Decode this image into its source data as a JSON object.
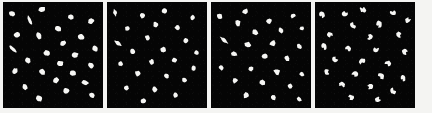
{
  "figure": {
    "panel_count": 4,
    "background_color": "#050505",
    "particle_color": "#f6f6f4",
    "page_background": "#f4f4f2",
    "width_px": 432,
    "height_px": 113
  },
  "layout": {
    "margin_left_px": 3,
    "margin_right_px": 4,
    "margin_top_px": 2,
    "margin_bottom_px": 5,
    "gap_px": 4,
    "panel_width_px": 100,
    "panel_height_px": 106
  },
  "chart_data": {
    "type": "scatter",
    "xlabel": "",
    "ylabel": "",
    "xlim": [
      0,
      100
    ],
    "ylim": [
      0,
      100
    ],
    "grid": false,
    "legend_position": "none",
    "panels": [
      {
        "index": 1,
        "label": "panel-1",
        "shape_style": "rounded-ellipse",
        "particle_count": 26,
        "particles": [
          {
            "x": 9,
            "y": 11,
            "rx": 3.0,
            "ry": 2.3,
            "rot": 20,
            "style": "ellipse"
          },
          {
            "x": 39,
            "y": 7,
            "rx": 3.4,
            "ry": 2.5,
            "rot": -15,
            "style": "ellipse"
          },
          {
            "x": 27,
            "y": 17,
            "rx": 4.6,
            "ry": 2.4,
            "rot": 62,
            "style": "comma"
          },
          {
            "x": 68,
            "y": 14,
            "rx": 2.9,
            "ry": 2.4,
            "rot": 5,
            "style": "ellipse"
          },
          {
            "x": 88,
            "y": 18,
            "rx": 3.1,
            "ry": 2.5,
            "rot": -28,
            "style": "ellipse"
          },
          {
            "x": 55,
            "y": 25,
            "rx": 3.2,
            "ry": 2.5,
            "rot": 40,
            "style": "ellipse"
          },
          {
            "x": 14,
            "y": 31,
            "rx": 3.0,
            "ry": 2.4,
            "rot": -10,
            "style": "ellipse"
          },
          {
            "x": 36,
            "y": 32,
            "rx": 3.3,
            "ry": 2.4,
            "rot": 70,
            "style": "ellipse"
          },
          {
            "x": 78,
            "y": 33,
            "rx": 3.4,
            "ry": 2.6,
            "rot": 15,
            "style": "ellipse"
          },
          {
            "x": 60,
            "y": 39,
            "rx": 3.0,
            "ry": 2.3,
            "rot": -35,
            "style": "ellipse"
          },
          {
            "x": 10,
            "y": 44,
            "rx": 5.0,
            "ry": 2.4,
            "rot": 40,
            "style": "comma"
          },
          {
            "x": 92,
            "y": 44,
            "rx": 3.0,
            "ry": 2.4,
            "rot": 25,
            "style": "ellipse"
          },
          {
            "x": 44,
            "y": 48,
            "rx": 3.2,
            "ry": 2.6,
            "rot": 10,
            "style": "ellipse"
          },
          {
            "x": 72,
            "y": 50,
            "rx": 3.3,
            "ry": 2.5,
            "rot": -20,
            "style": "ellipse"
          },
          {
            "x": 25,
            "y": 55,
            "rx": 3.1,
            "ry": 2.4,
            "rot": 55,
            "style": "ellipse"
          },
          {
            "x": 57,
            "y": 58,
            "rx": 3.4,
            "ry": 2.7,
            "rot": 0,
            "style": "ellipse"
          },
          {
            "x": 88,
            "y": 60,
            "rx": 3.0,
            "ry": 2.4,
            "rot": 30,
            "style": "ellipse"
          },
          {
            "x": 12,
            "y": 65,
            "rx": 3.0,
            "ry": 2.4,
            "rot": -25,
            "style": "ellipse"
          },
          {
            "x": 39,
            "y": 66,
            "rx": 3.3,
            "ry": 2.5,
            "rot": 45,
            "style": "ellipse"
          },
          {
            "x": 70,
            "y": 67,
            "rx": 3.2,
            "ry": 2.4,
            "rot": 12,
            "style": "ellipse"
          },
          {
            "x": 53,
            "y": 74,
            "rx": 3.1,
            "ry": 2.4,
            "rot": -40,
            "style": "ellipse"
          },
          {
            "x": 82,
            "y": 76,
            "rx": 3.6,
            "ry": 2.0,
            "rot": 18,
            "style": "ellipse"
          },
          {
            "x": 22,
            "y": 80,
            "rx": 3.0,
            "ry": 2.3,
            "rot": 60,
            "style": "ellipse"
          },
          {
            "x": 63,
            "y": 84,
            "rx": 3.1,
            "ry": 2.5,
            "rot": -8,
            "style": "ellipse"
          },
          {
            "x": 36,
            "y": 91,
            "rx": 3.2,
            "ry": 2.6,
            "rot": 28,
            "style": "ellipse"
          },
          {
            "x": 89,
            "y": 88,
            "rx": 2.8,
            "ry": 2.3,
            "rot": 35,
            "style": "ellipse"
          }
        ]
      },
      {
        "index": 2,
        "label": "panel-2",
        "shape_style": "angular-teardrop",
        "particle_count": 24,
        "particles": [
          {
            "x": 8,
            "y": 10,
            "rx": 3.6,
            "ry": 2.6,
            "rot": 75,
            "style": "bone"
          },
          {
            "x": 36,
            "y": 13,
            "rx": 3.3,
            "ry": 2.6,
            "rot": 20,
            "style": "teardrop"
          },
          {
            "x": 58,
            "y": 8,
            "rx": 3.2,
            "ry": 2.5,
            "rot": -30,
            "style": "teardrop"
          },
          {
            "x": 86,
            "y": 15,
            "rx": 3.1,
            "ry": 2.5,
            "rot": 45,
            "style": "teardrop"
          },
          {
            "x": 21,
            "y": 25,
            "rx": 3.0,
            "ry": 2.4,
            "rot": 10,
            "style": "teardrop"
          },
          {
            "x": 49,
            "y": 22,
            "rx": 3.4,
            "ry": 2.6,
            "rot": 60,
            "style": "teardrop"
          },
          {
            "x": 71,
            "y": 24,
            "rx": 3.2,
            "ry": 2.5,
            "rot": -15,
            "style": "teardrop"
          },
          {
            "x": 11,
            "y": 39,
            "rx": 5.0,
            "ry": 2.5,
            "rot": 35,
            "style": "bone"
          },
          {
            "x": 41,
            "y": 34,
            "rx": 3.1,
            "ry": 2.4,
            "rot": 25,
            "style": "teardrop"
          },
          {
            "x": 79,
            "y": 36,
            "rx": 3.3,
            "ry": 2.6,
            "rot": -40,
            "style": "teardrop"
          },
          {
            "x": 26,
            "y": 47,
            "rx": 3.2,
            "ry": 2.5,
            "rot": 50,
            "style": "teardrop"
          },
          {
            "x": 57,
            "y": 45,
            "rx": 3.4,
            "ry": 2.7,
            "rot": 5,
            "style": "teardrop"
          },
          {
            "x": 90,
            "y": 48,
            "rx": 3.0,
            "ry": 2.4,
            "rot": 30,
            "style": "teardrop"
          },
          {
            "x": 14,
            "y": 58,
            "rx": 3.1,
            "ry": 2.5,
            "rot": -20,
            "style": "teardrop"
          },
          {
            "x": 45,
            "y": 57,
            "rx": 3.3,
            "ry": 2.6,
            "rot": 40,
            "style": "teardrop"
          },
          {
            "x": 68,
            "y": 55,
            "rx": 3.2,
            "ry": 2.5,
            "rot": 15,
            "style": "teardrop"
          },
          {
            "x": 87,
            "y": 62,
            "rx": 3.0,
            "ry": 2.4,
            "rot": -35,
            "style": "teardrop"
          },
          {
            "x": 31,
            "y": 68,
            "rx": 3.4,
            "ry": 2.7,
            "rot": 55,
            "style": "teardrop"
          },
          {
            "x": 60,
            "y": 70,
            "rx": 3.1,
            "ry": 2.5,
            "rot": 0,
            "style": "teardrop"
          },
          {
            "x": 78,
            "y": 74,
            "rx": 3.2,
            "ry": 2.5,
            "rot": 25,
            "style": "teardrop"
          },
          {
            "x": 20,
            "y": 81,
            "rx": 3.0,
            "ry": 2.4,
            "rot": -10,
            "style": "teardrop"
          },
          {
            "x": 48,
            "y": 83,
            "rx": 3.3,
            "ry": 2.6,
            "rot": 48,
            "style": "teardrop"
          },
          {
            "x": 69,
            "y": 88,
            "rx": 3.1,
            "ry": 2.5,
            "rot": 18,
            "style": "teardrop"
          },
          {
            "x": 37,
            "y": 93,
            "rx": 3.2,
            "ry": 2.5,
            "rot": -28,
            "style": "teardrop"
          }
        ]
      },
      {
        "index": 3,
        "label": "panel-3",
        "shape_style": "irregular-polygon",
        "particle_count": 25,
        "particles": [
          {
            "x": 9,
            "y": 14,
            "rx": 3.2,
            "ry": 2.7,
            "rot": 30,
            "style": "polygon"
          },
          {
            "x": 34,
            "y": 9,
            "rx": 3.4,
            "ry": 2.6,
            "rot": -20,
            "style": "polygon"
          },
          {
            "x": 27,
            "y": 20,
            "rx": 3.3,
            "ry": 2.6,
            "rot": 55,
            "style": "polygon"
          },
          {
            "x": 58,
            "y": 18,
            "rx": 3.1,
            "ry": 2.5,
            "rot": 12,
            "style": "polygon"
          },
          {
            "x": 82,
            "y": 13,
            "rx": 3.0,
            "ry": 2.4,
            "rot": -45,
            "style": "polygon"
          },
          {
            "x": 44,
            "y": 28,
            "rx": 3.5,
            "ry": 2.7,
            "rot": 22,
            "style": "polygon"
          },
          {
            "x": 70,
            "y": 27,
            "rx": 3.2,
            "ry": 2.6,
            "rot": 65,
            "style": "polygon"
          },
          {
            "x": 91,
            "y": 25,
            "rx": 3.0,
            "ry": 2.4,
            "rot": -12,
            "style": "polygon"
          },
          {
            "x": 13,
            "y": 36,
            "rx": 5.2,
            "ry": 2.5,
            "rot": 38,
            "style": "bone"
          },
          {
            "x": 37,
            "y": 40,
            "rx": 3.3,
            "ry": 2.6,
            "rot": 8,
            "style": "polygon"
          },
          {
            "x": 62,
            "y": 39,
            "rx": 3.4,
            "ry": 2.7,
            "rot": -30,
            "style": "polygon"
          },
          {
            "x": 88,
            "y": 42,
            "rx": 3.1,
            "ry": 2.5,
            "rot": 50,
            "style": "polygon"
          },
          {
            "x": 23,
            "y": 49,
            "rx": 3.2,
            "ry": 2.6,
            "rot": 18,
            "style": "polygon"
          },
          {
            "x": 54,
            "y": 51,
            "rx": 3.6,
            "ry": 2.8,
            "rot": -8,
            "style": "polygon"
          },
          {
            "x": 76,
            "y": 53,
            "rx": 3.2,
            "ry": 2.5,
            "rot": 42,
            "style": "polygon"
          },
          {
            "x": 10,
            "y": 62,
            "rx": 3.0,
            "ry": 2.5,
            "rot": 25,
            "style": "polygon"
          },
          {
            "x": 40,
            "y": 63,
            "rx": 3.3,
            "ry": 2.6,
            "rot": -35,
            "style": "polygon"
          },
          {
            "x": 66,
            "y": 66,
            "rx": 3.4,
            "ry": 2.7,
            "rot": 14,
            "style": "polygon"
          },
          {
            "x": 91,
            "y": 68,
            "rx": 3.0,
            "ry": 2.4,
            "rot": 58,
            "style": "polygon"
          },
          {
            "x": 24,
            "y": 74,
            "rx": 3.2,
            "ry": 2.6,
            "rot": -18,
            "style": "polygon"
          },
          {
            "x": 51,
            "y": 76,
            "rx": 3.3,
            "ry": 2.6,
            "rot": 32,
            "style": "polygon"
          },
          {
            "x": 79,
            "y": 79,
            "rx": 3.1,
            "ry": 2.5,
            "rot": 5,
            "style": "polygon"
          },
          {
            "x": 35,
            "y": 88,
            "rx": 3.4,
            "ry": 2.7,
            "rot": -25,
            "style": "polygon"
          },
          {
            "x": 62,
            "y": 90,
            "rx": 3.2,
            "ry": 2.6,
            "rot": 45,
            "style": "polygon"
          },
          {
            "x": 88,
            "y": 92,
            "rx": 2.9,
            "ry": 2.3,
            "rot": 20,
            "style": "polygon"
          }
        ]
      },
      {
        "index": 4,
        "label": "panel-4",
        "shape_style": "notched-crescent",
        "particle_count": 26,
        "particles": [
          {
            "x": 7,
            "y": 12,
            "rx": 3.3,
            "ry": 2.6,
            "rot": 70,
            "style": "crescent"
          },
          {
            "x": 30,
            "y": 11,
            "rx": 3.2,
            "ry": 2.5,
            "rot": -22,
            "style": "notched"
          },
          {
            "x": 48,
            "y": 7,
            "rx": 3.4,
            "ry": 2.6,
            "rot": 35,
            "style": "notched"
          },
          {
            "x": 78,
            "y": 10,
            "rx": 3.1,
            "ry": 2.5,
            "rot": 10,
            "style": "notched"
          },
          {
            "x": 93,
            "y": 17,
            "rx": 3.0,
            "ry": 2.4,
            "rot": -40,
            "style": "notched"
          },
          {
            "x": 38,
            "y": 22,
            "rx": 3.3,
            "ry": 2.6,
            "rot": 48,
            "style": "notched"
          },
          {
            "x": 64,
            "y": 21,
            "rx": 3.5,
            "ry": 2.7,
            "rot": 82,
            "style": "crescent"
          },
          {
            "x": 15,
            "y": 31,
            "rx": 3.1,
            "ry": 2.5,
            "rot": 16,
            "style": "notched"
          },
          {
            "x": 55,
            "y": 33,
            "rx": 3.2,
            "ry": 2.6,
            "rot": -30,
            "style": "notched"
          },
          {
            "x": 84,
            "y": 31,
            "rx": 3.3,
            "ry": 2.6,
            "rot": 55,
            "style": "notched"
          },
          {
            "x": 9,
            "y": 42,
            "rx": 3.4,
            "ry": 2.5,
            "rot": 68,
            "style": "crescent"
          },
          {
            "x": 33,
            "y": 44,
            "rx": 3.2,
            "ry": 2.6,
            "rot": 8,
            "style": "notched"
          },
          {
            "x": 61,
            "y": 45,
            "rx": 3.0,
            "ry": 2.4,
            "rot": -15,
            "style": "notched"
          },
          {
            "x": 90,
            "y": 47,
            "rx": 3.3,
            "ry": 2.6,
            "rot": 40,
            "style": "notched"
          },
          {
            "x": 20,
            "y": 54,
            "rx": 3.1,
            "ry": 2.5,
            "rot": 25,
            "style": "notched"
          },
          {
            "x": 47,
            "y": 56,
            "rx": 3.4,
            "ry": 2.7,
            "rot": -38,
            "style": "notched"
          },
          {
            "x": 73,
            "y": 58,
            "rx": 3.2,
            "ry": 2.6,
            "rot": 12,
            "style": "notched"
          },
          {
            "x": 12,
            "y": 66,
            "rx": 3.0,
            "ry": 2.4,
            "rot": 60,
            "style": "notched"
          },
          {
            "x": 40,
            "y": 68,
            "rx": 3.3,
            "ry": 2.6,
            "rot": -5,
            "style": "notched"
          },
          {
            "x": 66,
            "y": 70,
            "rx": 3.5,
            "ry": 2.7,
            "rot": 30,
            "style": "notched"
          },
          {
            "x": 88,
            "y": 72,
            "rx": 3.0,
            "ry": 2.4,
            "rot": 75,
            "style": "crescent"
          },
          {
            "x": 27,
            "y": 78,
            "rx": 3.2,
            "ry": 2.6,
            "rot": 20,
            "style": "notched"
          },
          {
            "x": 55,
            "y": 80,
            "rx": 3.1,
            "ry": 2.5,
            "rot": -28,
            "style": "notched"
          },
          {
            "x": 78,
            "y": 84,
            "rx": 3.3,
            "ry": 2.6,
            "rot": 45,
            "style": "notched"
          },
          {
            "x": 36,
            "y": 90,
            "rx": 3.2,
            "ry": 2.5,
            "rot": 14,
            "style": "notched"
          },
          {
            "x": 63,
            "y": 92,
            "rx": 3.0,
            "ry": 2.4,
            "rot": -18,
            "style": "notched"
          }
        ]
      }
    ]
  }
}
